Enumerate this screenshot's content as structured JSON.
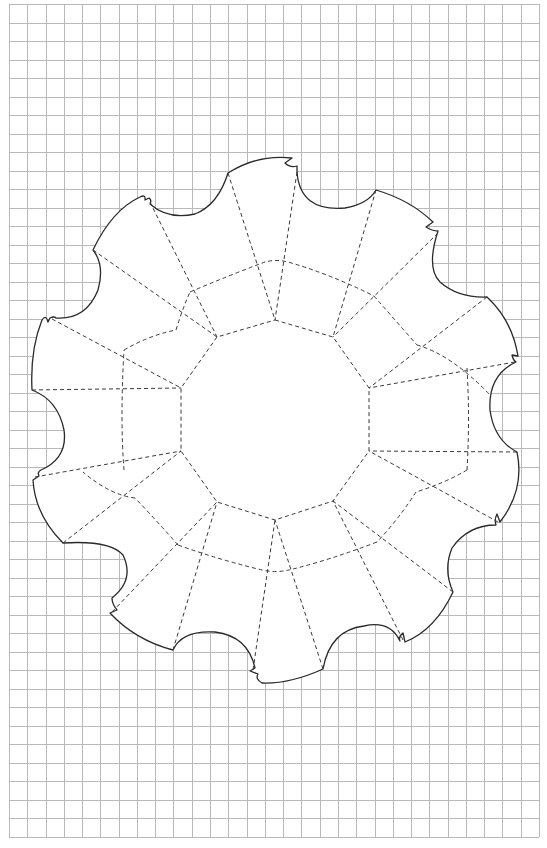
{
  "diagram": {
    "type": "papercraft-template",
    "grid": {
      "x0": 9,
      "y0": 4,
      "x1": 539,
      "y1": 837,
      "cols": 29,
      "rows": 45,
      "color": "#b9b9b9"
    },
    "outline_color": "#2a2a2a",
    "fold_line_color": "#3a3a3a",
    "fold_line_style": "dashed",
    "center_polygon": {
      "sides": 10,
      "vertices": [
        [
          275,
          320
        ],
        [
          333,
          337
        ],
        [
          369,
          388
        ],
        [
          369,
          451
        ],
        [
          333,
          501
        ],
        [
          275,
          520
        ],
        [
          217,
          502
        ],
        [
          181,
          451
        ],
        [
          181,
          388
        ],
        [
          217,
          337
        ]
      ]
    },
    "petal_count": 10
  }
}
